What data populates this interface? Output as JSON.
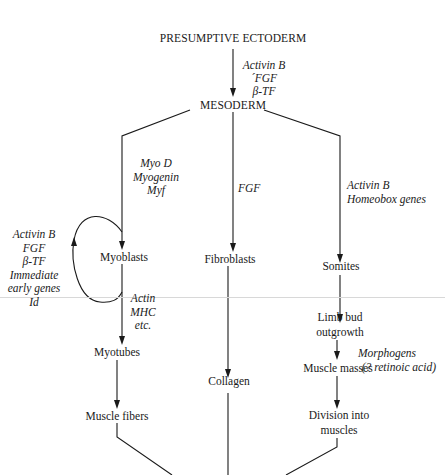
{
  "diagram": {
    "root": "PRESUMPTIVE ECTODERM",
    "root_to_mesoderm_factors": [
      "Activin B",
      "´FGF",
      "β-TF"
    ],
    "mesoderm": "MESODERM",
    "left_branch": {
      "factors": [
        "Myo D",
        "Myogenin",
        "Myf"
      ],
      "myoblasts": "Myoblasts",
      "loop_factors": [
        "Activin B",
        "FGF",
        "β-TF",
        "Immediate",
        "early genes",
        "Id"
      ],
      "myotube_factors": [
        "Actin",
        "MHC",
        "etc."
      ],
      "myotubes": "Myotubes",
      "muscle_fibers": "Muscle fibers"
    },
    "center_branch": {
      "factors": [
        "FGF"
      ],
      "fibroblasts": "Fibroblasts",
      "collagen": "Collagen"
    },
    "right_branch": {
      "factors": [
        "Activin B",
        "Homeobox genes"
      ],
      "somites": "Somites",
      "limb_bud": [
        "Limb bud",
        "outgrowth"
      ],
      "morphogen_factors": [
        "Morphogens",
        "(? retinoic acid)"
      ],
      "muscle_masses": "Muscle masses",
      "division": [
        "Division into",
        "muscles"
      ]
    }
  }
}
